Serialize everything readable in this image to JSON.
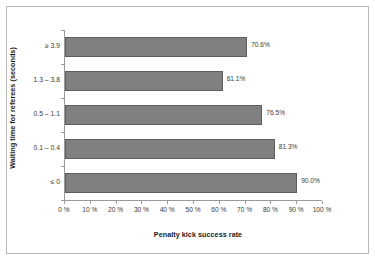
{
  "chart_data": {
    "type": "bar",
    "orientation": "horizontal",
    "title": "",
    "xlabel": "Penalty kick success rate",
    "ylabel": "Waiting time for referees (seconds)",
    "categories": [
      "≥ 3.9",
      "1.3 – 3.8",
      "0.5 – 1.1",
      "0.1 – 0.4",
      "≤ 0"
    ],
    "values": [
      70.6,
      61.1,
      76.5,
      81.3,
      90.0
    ],
    "data_labels": [
      "70.6%",
      "61.1%",
      "76.5%",
      "81.3%",
      "90.0%"
    ],
    "xlim": [
      0,
      100
    ],
    "xticks": [
      0,
      10,
      20,
      30,
      40,
      50,
      60,
      70,
      80,
      90,
      100
    ],
    "xtick_labels": [
      "0 %",
      "10 %",
      "20 %",
      "30 %",
      "40 %",
      "50 %",
      "60 %",
      "70 %",
      "80 %",
      "90 %",
      "100 %"
    ],
    "grid": false,
    "legend": false,
    "bar_color": "#808080",
    "bar_border_color": "#5e5e5e",
    "axis_color": "#9a9a9a",
    "frame_color": "#b8b8b8",
    "text_color": "#3a3a3a"
  }
}
